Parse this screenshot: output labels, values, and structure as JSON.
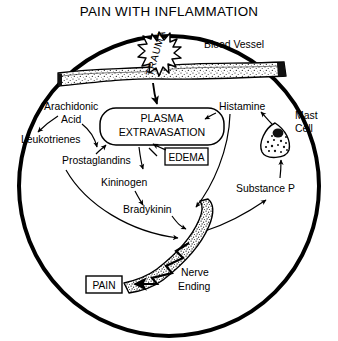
{
  "figure": {
    "title": "PAIN WITH INFLAMMATION",
    "type": "biological-pathway-diagram",
    "shape": "circle-field"
  },
  "labels": {
    "blood_vessel": "Blood Vessel",
    "trauma": "TRAUMA",
    "arachidonic_acid_line1": "Arachidonic",
    "arachidonic_acid_line2": "Acid",
    "leukotrienes": "Leukotrienes",
    "plasma_line1": "PLASMA",
    "plasma_line2": "EXTRAVASATION",
    "edema": "EDEMA",
    "histamine": "Histamine",
    "mast_cell_line1": "Mast",
    "mast_cell_line2": "Cell",
    "prostaglandins": "Prostaglandins",
    "kininogen": "Kininogen",
    "bradykinin": "Bradykinin",
    "substance_p": "Substance P",
    "nerve_ending_line1": "Nerve",
    "nerve_ending_line2": "Ending",
    "pain": "PAIN"
  },
  "boxed_labels": [
    "PLASMA EXTRAVASATION",
    "EDEMA",
    "PAIN"
  ],
  "pathway": {
    "nodes": [
      "TRAUMA",
      "Blood Vessel",
      "Arachidonic Acid",
      "Leukotrienes",
      "Prostaglandins",
      "PLASMA EXTRAVASATION",
      "EDEMA",
      "Kininogen",
      "Bradykinin",
      "Histamine",
      "Mast Cell",
      "Substance P",
      "Nerve Ending",
      "PAIN"
    ],
    "edges": [
      {
        "from": "TRAUMA",
        "to": "PLASMA EXTRAVASATION"
      },
      {
        "from": "Arachidonic Acid",
        "to": "Leukotrienes"
      },
      {
        "from": "Arachidonic Acid",
        "to": "Prostaglandins"
      },
      {
        "from": "Prostaglandins",
        "to": "PLASMA EXTRAVASATION"
      },
      {
        "from": "Prostaglandins",
        "to": "Nerve Ending"
      },
      {
        "from": "PLASMA EXTRAVASATION",
        "to": "EDEMA"
      },
      {
        "from": "EDEMA",
        "to": "PLASMA EXTRAVASATION"
      },
      {
        "from": "PLASMA EXTRAVASATION",
        "to": "Kininogen"
      },
      {
        "from": "Kininogen",
        "to": "Bradykinin"
      },
      {
        "from": "Bradykinin",
        "to": "Nerve Ending"
      },
      {
        "from": "Histamine",
        "to": "PLASMA EXTRAVASATION"
      },
      {
        "from": "Histamine",
        "to": "Nerve Ending"
      },
      {
        "from": "Mast Cell",
        "to": "Histamine"
      },
      {
        "from": "Substance P",
        "to": "Mast Cell"
      },
      {
        "from": "Nerve Ending",
        "to": "Substance P"
      },
      {
        "from": "Nerve Ending",
        "to": "PAIN"
      }
    ]
  },
  "colors": {
    "ink": "#000000",
    "background": "#ffffff",
    "stipple": "#404040"
  }
}
